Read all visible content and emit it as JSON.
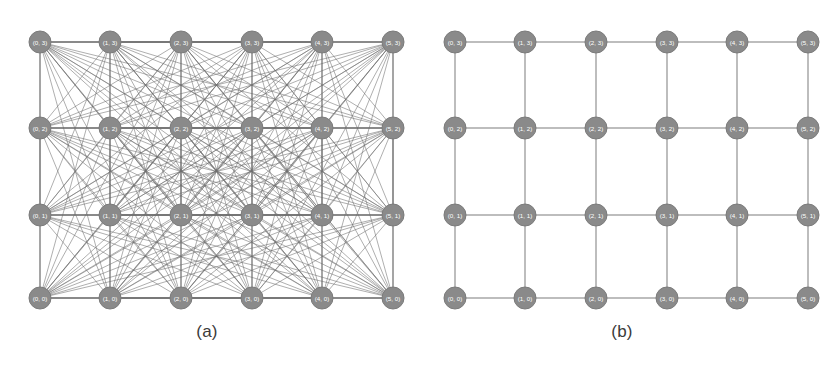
{
  "figure": {
    "background_color": "#ffffff",
    "node_fill_color": "#8a8a8a",
    "node_stroke_color": "#7b7b7b",
    "node_label_color": "#ffffff",
    "edge_color": "#6e6e6e",
    "caption_color": "#3a3a3a"
  },
  "panels": [
    {
      "id": "a",
      "caption": "(a)",
      "graph_type": "complete",
      "description": "complete-graph-on-grid-nodes"
    },
    {
      "id": "b",
      "caption": "(b)",
      "graph_type": "lattice",
      "description": "grid-lattice-nearest-neighbour"
    }
  ],
  "chart_data": {
    "type": "scatter",
    "title": "",
    "xlabel": "",
    "ylabel": "",
    "grid_cols": 6,
    "grid_rows": 4,
    "xlim": [
      0,
      5
    ],
    "ylim": [
      0,
      3
    ],
    "x_values": [
      0,
      1,
      2,
      3,
      4,
      5
    ],
    "y_values": [
      0,
      1,
      2,
      3
    ],
    "node_radius_px": 11,
    "node_pixel_cols": [
      40,
      110,
      181,
      252,
      322,
      393
    ],
    "node_pixel_rows": [
      42,
      128,
      215,
      298
    ],
    "nodes": [
      {
        "id": "0-3",
        "label": "(0, 3)",
        "x": 0,
        "y": 3
      },
      {
        "id": "1-3",
        "label": "(1, 3)",
        "x": 1,
        "y": 3
      },
      {
        "id": "2-3",
        "label": "(2, 3)",
        "x": 2,
        "y": 3
      },
      {
        "id": "3-3",
        "label": "(3, 3)",
        "x": 3,
        "y": 3
      },
      {
        "id": "4-3",
        "label": "(4, 3)",
        "x": 4,
        "y": 3
      },
      {
        "id": "5-3",
        "label": "(5, 3)",
        "x": 5,
        "y": 3
      },
      {
        "id": "0-2",
        "label": "(0, 2)",
        "x": 0,
        "y": 2
      },
      {
        "id": "1-2",
        "label": "(1, 2)",
        "x": 1,
        "y": 2
      },
      {
        "id": "2-2",
        "label": "(2, 2)",
        "x": 2,
        "y": 2
      },
      {
        "id": "3-2",
        "label": "(3, 2)",
        "x": 3,
        "y": 2
      },
      {
        "id": "4-2",
        "label": "(4, 2)",
        "x": 4,
        "y": 2
      },
      {
        "id": "5-2",
        "label": "(5, 2)",
        "x": 5,
        "y": 2
      },
      {
        "id": "0-1",
        "label": "(0, 1)",
        "x": 0,
        "y": 1
      },
      {
        "id": "1-1",
        "label": "(1, 1)",
        "x": 1,
        "y": 1
      },
      {
        "id": "2-1",
        "label": "(2, 1)",
        "x": 2,
        "y": 1
      },
      {
        "id": "3-1",
        "label": "(3, 1)",
        "x": 3,
        "y": 1
      },
      {
        "id": "4-1",
        "label": "(4, 1)",
        "x": 4,
        "y": 1
      },
      {
        "id": "5-1",
        "label": "(5, 1)",
        "x": 5,
        "y": 1
      },
      {
        "id": "0-0",
        "label": "(0, 0)",
        "x": 0,
        "y": 0
      },
      {
        "id": "1-0",
        "label": "(1, 0)",
        "x": 1,
        "y": 0
      },
      {
        "id": "2-0",
        "label": "(2, 0)",
        "x": 2,
        "y": 0
      },
      {
        "id": "3-0",
        "label": "(3, 0)",
        "x": 3,
        "y": 0
      },
      {
        "id": "4-0",
        "label": "(4, 0)",
        "x": 4,
        "y": 0
      },
      {
        "id": "5-0",
        "label": "(5, 0)",
        "x": 5,
        "y": 0
      }
    ]
  }
}
